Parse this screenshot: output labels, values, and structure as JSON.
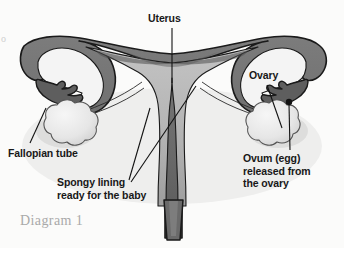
{
  "figure": {
    "caption": "Diagram 1",
    "edge_mark": "o",
    "background_color": "#fbfbfa",
    "outline_color": "#1a1a1a",
    "wall_color": "#6f6f6f",
    "wall_color_dark": "#5a5a5a",
    "cavity_color": "#b4b4b4",
    "tube_lumen_color": "#e8e8e8",
    "ovary_color": "#ececec",
    "leader_line_color": "#111111"
  },
  "labels": {
    "uterus": "Uterus",
    "ovary": "Ovary",
    "fallopian_tube": "Fallopian tube",
    "spongy_lining": "Spongy lining\nready for the baby",
    "ovum": "Ovum (egg)\nreleased from\nthe ovary"
  },
  "parts": [
    {
      "name": "uterus",
      "label": "Uterus"
    },
    {
      "name": "ovary",
      "label": "Ovary"
    },
    {
      "name": "fallopian-tube",
      "label": "Fallopian tube"
    },
    {
      "name": "endometrium",
      "label": "Spongy lining ready for the baby"
    },
    {
      "name": "ovum",
      "label": "Ovum (egg) released from the ovary"
    },
    {
      "name": "cervix",
      "label": ""
    }
  ]
}
